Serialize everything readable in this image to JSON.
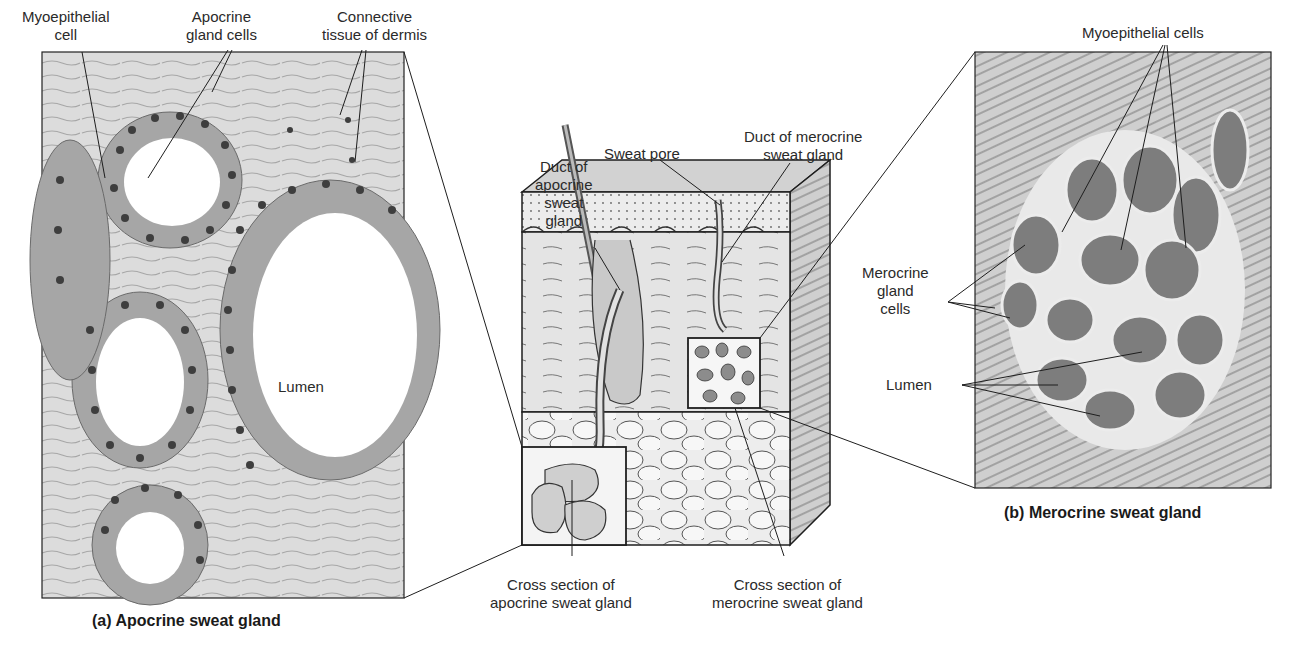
{
  "figure": {
    "panel_a": {
      "caption": "(a) Apocrine sweat gland",
      "labels": {
        "myoepithelial_cell": [
          "Myoepithelial",
          "cell"
        ],
        "apocrine_gland_cells": [
          "Apocrine",
          "gland cells"
        ],
        "connective_tissue": [
          "Connective",
          "tissue of dermis"
        ],
        "lumen": "Lumen"
      }
    },
    "center": {
      "labels": {
        "sweat_pore": "Sweat pore",
        "duct_merocrine": [
          "Duct of merocrine",
          "sweat gland"
        ],
        "duct_apocrine": [
          "Duct of",
          "apocrine",
          "sweat",
          "gland"
        ],
        "cross_section_apocrine": [
          "Cross section of",
          "apocrine sweat gland"
        ],
        "cross_section_merocrine": [
          "Cross section of",
          "merocrine sweat gland"
        ]
      }
    },
    "panel_b": {
      "caption": "(b) Merocrine sweat gland",
      "labels": {
        "myoepithelial_cells": "Myoepithelial cells",
        "merocrine_gland_cells": [
          "Merocrine",
          "gland",
          "cells"
        ],
        "lumen": "Lumen"
      }
    },
    "colors": {
      "tissue_bg": "#d8d8d8",
      "cell_fill": "#9a9a9a",
      "nucleus": "#3c3c3c",
      "line": "#1e1e1e"
    }
  }
}
